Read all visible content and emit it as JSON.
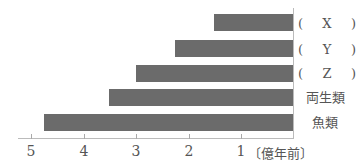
{
  "chart_data": {
    "type": "bar",
    "orientation": "horizontal",
    "title": "",
    "xlabel": "億年前",
    "ylabel": "",
    "categories": [
      "( X )",
      "( Y )",
      "( Z )",
      "両生類",
      "魚類"
    ],
    "category_parts": [
      {
        "open": "(",
        "mid": "X",
        "close": ")"
      },
      {
        "open": "(",
        "mid": "Y",
        "close": ")"
      },
      {
        "open": "(",
        "mid": "Z",
        "close": ")"
      },
      {
        "text": "両生類"
      },
      {
        "text": "魚類"
      }
    ],
    "values": [
      1.5,
      2.25,
      3.0,
      3.5,
      4.75
    ],
    "xlim": [
      0,
      5.2
    ],
    "x_axis_reversed": true,
    "xticks": [
      "5",
      "4",
      "3",
      "2",
      "1"
    ],
    "unit_label": "〔億年前〕",
    "grid": false,
    "legend": null,
    "bar_color": "#6b6b6b"
  }
}
